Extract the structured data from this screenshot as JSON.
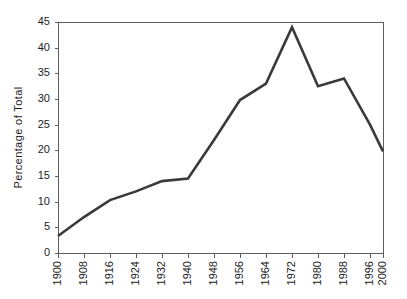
{
  "chart_data": {
    "type": "line",
    "title": "",
    "subtitle": "",
    "xlabel": "",
    "ylabel": "Percentage of Total",
    "grid": false,
    "legend": false,
    "legend_position": "none",
    "line_color": "#3a3a3a",
    "frame_color": "#5d5d5d",
    "background_color": "#ffffff",
    "xlim": [
      1900,
      2000
    ],
    "ylim": [
      0,
      45
    ],
    "ytick_labels": [
      "0",
      "5",
      "10",
      "15",
      "20",
      "25",
      "30",
      "35",
      "40",
      "45"
    ],
    "ytick_values": [
      0,
      5,
      10,
      15,
      20,
      25,
      30,
      35,
      40,
      45
    ],
    "xtick_labels": [
      "1900",
      "1908",
      "1916",
      "1924",
      "1932",
      "1940",
      "1948",
      "1956",
      "1964",
      "1972",
      "1980",
      "1988",
      "1996",
      "2000"
    ],
    "categories": [
      1900,
      1908,
      1916,
      1924,
      1932,
      1940,
      1948,
      1956,
      1964,
      1972,
      1980,
      1988,
      1996,
      2000
    ],
    "x": [
      1900,
      1908,
      1916,
      1924,
      1932,
      1940,
      1948,
      1956,
      1964,
      1972,
      1980,
      1988,
      1996,
      2000
    ],
    "values": [
      3.3,
      7.0,
      10.3,
      12.0,
      14.0,
      14.5,
      22.0,
      29.8,
      33.0,
      44.0,
      32.5,
      34.0,
      25.0,
      19.8
    ],
    "series": [
      {
        "name": "Percentage of Total",
        "values": [
          3.3,
          7.0,
          10.3,
          12.0,
          14.0,
          14.5,
          22.0,
          29.8,
          33.0,
          44.0,
          32.5,
          34.0,
          25.0,
          19.8
        ]
      }
    ],
    "annotations": []
  },
  "layout": {
    "plot_left": 58,
    "plot_top": 22,
    "plot_right": 383,
    "plot_bottom": 253,
    "tick_length": 4,
    "ylabel_x": 22,
    "xlabel_baseline": 261
  }
}
